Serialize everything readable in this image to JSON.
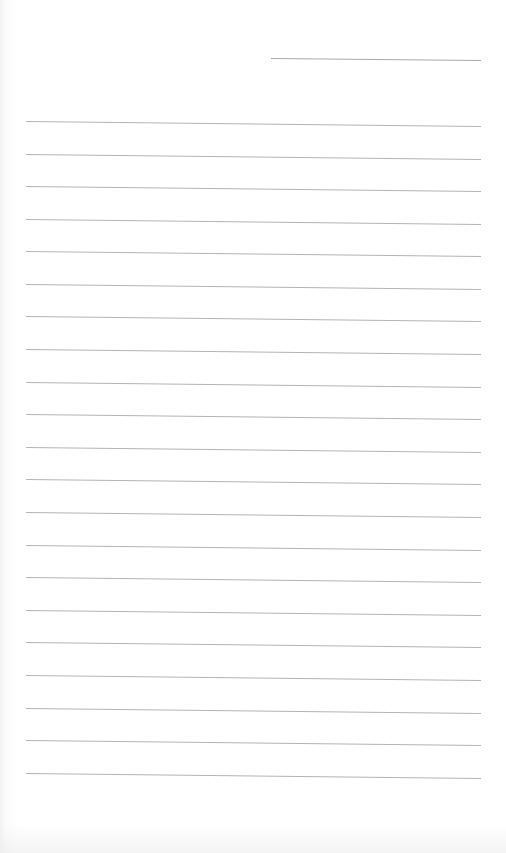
{
  "page": {
    "type": "lined-paper",
    "background_color": "#ffffff",
    "line_color": "#b4b4b4"
  },
  "header": {
    "date_line": {
      "label": ""
    }
  },
  "ruled_lines": [
    {
      "top": 121
    },
    {
      "top": 154
    },
    {
      "top": 186
    },
    {
      "top": 219
    },
    {
      "top": 251
    },
    {
      "top": 284
    },
    {
      "top": 316
    },
    {
      "top": 349
    },
    {
      "top": 382
    },
    {
      "top": 414
    },
    {
      "top": 447
    },
    {
      "top": 479
    },
    {
      "top": 512
    },
    {
      "top": 545
    },
    {
      "top": 577
    },
    {
      "top": 610
    },
    {
      "top": 642
    },
    {
      "top": 675
    },
    {
      "top": 708
    },
    {
      "top": 740
    },
    {
      "top": 773
    }
  ]
}
